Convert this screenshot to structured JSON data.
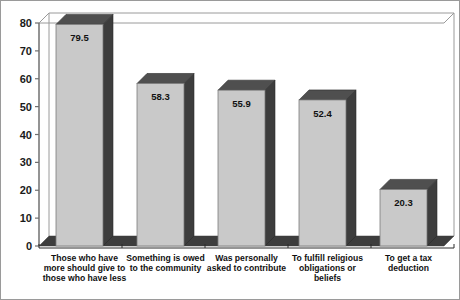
{
  "chart_data": {
    "type": "bar",
    "title": "",
    "subtitle": "",
    "xlabel": "",
    "ylabel": "",
    "ylim": [
      0,
      80
    ],
    "yticks": [
      0,
      10,
      20,
      30,
      40,
      50,
      60,
      70,
      80
    ],
    "ytick_labels": [
      "0",
      "10",
      "20",
      "30",
      "40",
      "50",
      "60",
      "70",
      "80"
    ],
    "grid": false,
    "legend": false,
    "legend_position": "none",
    "three_d": true,
    "categories": [
      "Those who have more should give to those who have less",
      "Something is owed to the community",
      "Was personally asked to contribute",
      "To fulfill religious obligations or beliefs",
      "To get a tax deduction"
    ],
    "category_lines": [
      [
        "Those who have",
        "more should give to",
        "those who have less"
      ],
      [
        "Something is owed",
        "to the community"
      ],
      [
        "Was personally",
        "asked to contribute"
      ],
      [
        "To fulfill religious",
        "obligations or",
        "beliefs"
      ],
      [
        "To get a tax",
        "deduction"
      ]
    ],
    "values": [
      79.5,
      58.3,
      55.9,
      52.4,
      20.3
    ],
    "value_labels": [
      "79.5",
      "58.3",
      "55.9",
      "52.4",
      "20.3"
    ],
    "colors": {
      "bar_front": "#c9c9c9",
      "bar_top": "#4f4f4f",
      "bar_side": "#3d3d3d",
      "floor": "#3d3d3d",
      "axis": "#6f6f6f",
      "frame": "#9a9a9a",
      "text": "#111111",
      "background": "#ffffff"
    }
  }
}
